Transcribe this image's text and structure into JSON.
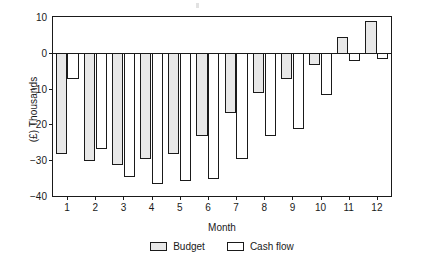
{
  "chart_data": {
    "type": "bar",
    "title": "",
    "xlabel": "Month",
    "ylabel": "(£) Thousands",
    "categories": [
      "1",
      "2",
      "3",
      "4",
      "5",
      "6",
      "7",
      "8",
      "9",
      "10",
      "11",
      "12"
    ],
    "series": [
      {
        "name": "Budget",
        "fill": "#e8e8e8",
        "values": [
          -28,
          -30,
          -31,
          -29.5,
          -28,
          -23,
          -16.5,
          -11,
          -7,
          -3,
          4.5,
          9
        ]
      },
      {
        "name": "Cash flow",
        "fill": "#ffffff",
        "values": [
          -7,
          -26.5,
          -34.5,
          -36.5,
          -35.5,
          -35,
          -29.5,
          -23,
          -21,
          -11.5,
          -2,
          -1.5
        ]
      }
    ],
    "ylim": [
      -40,
      10
    ],
    "yticks": [
      10,
      0,
      -10,
      -20,
      -30,
      -40
    ],
    "ytick_labels": [
      "10",
      "0",
      "−10",
      "−20",
      "−30",
      "−40"
    ],
    "grid": false,
    "legend_position": "bottom-center",
    "axis_color": "#1a1a1a"
  },
  "legend": {
    "entries": [
      {
        "label": "Budget"
      },
      {
        "label": "Cash flow"
      }
    ]
  }
}
